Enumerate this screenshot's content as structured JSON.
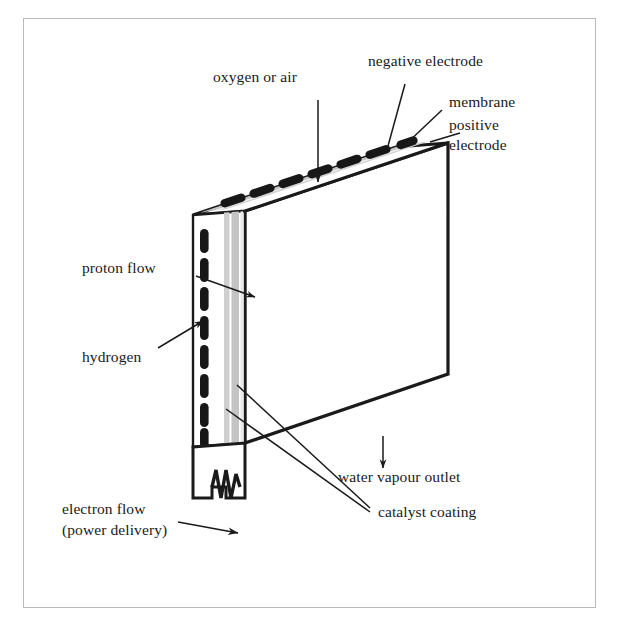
{
  "figure": {
    "kind": "fuel-cell-cutaway-diagram",
    "title": "",
    "background": "#ffffff",
    "frame_color": "#b9b9bb",
    "ink": "#1a1a1a",
    "membrane_gray": "#c6c6c6",
    "catalyst_gray": "#d8d8d8",
    "electrode_black": "#171717"
  },
  "labels": {
    "oxygen_or_air": "oxygen or air",
    "negative_electrode": "negative electrode",
    "membrane": "membrane",
    "positive_electrode_line1": "positive",
    "positive_electrode_line2": "electrode",
    "proton_flow": "proton flow",
    "hydrogen": "hydrogen",
    "water_vapour_outlet": "water vapour outlet",
    "catalyst_coating": "catalyst coating",
    "electron_flow_line1": "electron flow",
    "electron_flow_line2": "(power delivery)"
  },
  "counts": {
    "top_face_electrodes": 7,
    "side_face_electrodes": 9,
    "membrane_bands": 2
  }
}
